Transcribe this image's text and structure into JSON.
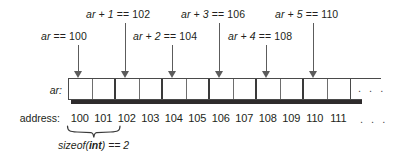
{
  "diagram": {
    "row_labels": {
      "array": "ar:",
      "address": "address:"
    },
    "pointer_labels": [
      {
        "id": "ar+0",
        "var": "ar",
        "op": " == 100",
        "text": "ar == 100",
        "x": 41,
        "y": 30,
        "arrow_x": 78,
        "arrow_top": 45
      },
      {
        "id": "ar+1",
        "var": "ar + 1",
        "op": " == 102",
        "text": "ar + 1 == 102",
        "x": 86,
        "y": 8,
        "arrow_x": 125,
        "arrow_top": 23
      },
      {
        "id": "ar+2",
        "var": "ar + 2",
        "op": " == 104",
        "text": "ar + 2 == 104",
        "x": 133,
        "y": 30,
        "arrow_x": 172,
        "arrow_top": 45
      },
      {
        "id": "ar+3",
        "var": "ar + 3",
        "op": " == 106",
        "text": "ar + 3 == 106",
        "x": 181,
        "y": 8,
        "arrow_x": 219,
        "arrow_top": 23
      },
      {
        "id": "ar+4",
        "var": "ar + 4",
        "op": " == 108",
        "text": "ar + 4 == 108",
        "x": 228,
        "y": 30,
        "arrow_x": 266,
        "arrow_top": 45
      },
      {
        "id": "ar+5",
        "var": "ar + 5",
        "op": " == 110",
        "text": "ar + 5 == 110",
        "x": 275,
        "y": 8,
        "arrow_x": 313,
        "arrow_top": 23
      }
    ],
    "cells": [
      {
        "address": "100",
        "major": false
      },
      {
        "address": "101",
        "major": true
      },
      {
        "address": "102",
        "major": false
      },
      {
        "address": "103",
        "major": true
      },
      {
        "address": "104",
        "major": false
      },
      {
        "address": "105",
        "major": true
      },
      {
        "address": "106",
        "major": false
      },
      {
        "address": "107",
        "major": true
      },
      {
        "address": "108",
        "major": false
      },
      {
        "address": "109",
        "major": true
      },
      {
        "address": "110",
        "major": false
      },
      {
        "address": "111",
        "major": true
      }
    ],
    "continuation_dots": ". . .",
    "address_continuation_dots": ". . .",
    "sizeof_caption_prefix": "sizeof(",
    "sizeof_caption_keyword": "int",
    "sizeof_caption_suffix": ") == 2",
    "sizeof_caption_text": "sizeof(int) == 2",
    "colors": {
      "ink": "#231f20",
      "cell_border": "#4a4a4a",
      "cell_divider_minor": "#6e6e6e",
      "cell_divider_major": "#3a3a3a",
      "arrow": "#5c5c5c",
      "shadow": "#2e2b2c",
      "background": "#ffffff"
    },
    "geometry": {
      "cells_left": 68,
      "cells_top": 78,
      "cell_width": 23.5,
      "cell_height": 22,
      "rail_right": 381,
      "address_baseline_top": 112
    }
  }
}
